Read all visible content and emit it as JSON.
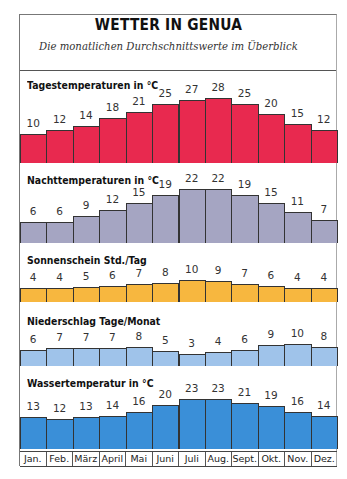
{
  "title": "WETTER IN GENUA",
  "subtitle": "Die monatlichen Durchschnittswerte im Überblick",
  "months": [
    "Jan.",
    "Feb.",
    "März",
    "April",
    "Mai",
    "Juni",
    "Juli",
    "Aug.",
    "Sept.",
    "Okt.",
    "Nov.",
    "Dez."
  ],
  "sections": [
    {
      "label": "Tagestemperaturen in °C",
      "color": "#e8294f",
      "values": [
        10,
        12,
        14,
        18,
        21,
        25,
        27,
        28,
        25,
        20,
        15,
        12
      ]
    },
    {
      "label": "Nachttemperaturen in °C",
      "color": "#a5a5c2",
      "values": [
        6,
        6,
        9,
        12,
        15,
        19,
        22,
        22,
        19,
        15,
        11,
        7
      ]
    },
    {
      "label": "Sonnenschein Std./Tag",
      "color": "#f7b73f",
      "values": [
        4,
        4,
        5,
        6,
        7,
        8,
        10,
        9,
        7,
        6,
        4,
        4
      ]
    },
    {
      "label": "Niederschlag Tage/Monat",
      "color": "#9fc3ea",
      "values": [
        6,
        7,
        7,
        7,
        8,
        5,
        3,
        4,
        6,
        9,
        10,
        8
      ]
    },
    {
      "label": "Wassertemperatur in °C",
      "color": "#3a8fd8",
      "values": [
        13,
        12,
        13,
        14,
        16,
        20,
        23,
        23,
        21,
        19,
        16,
        14
      ]
    }
  ],
  "chart_data": [
    {
      "type": "bar",
      "title": "Tagestemperaturen in °C",
      "categories": [
        "Jan.",
        "Feb.",
        "März",
        "April",
        "Mai",
        "Juni",
        "Juli",
        "Aug.",
        "Sept.",
        "Okt.",
        "Nov.",
        "Dez."
      ],
      "values": [
        10,
        12,
        14,
        18,
        21,
        25,
        27,
        28,
        25,
        20,
        15,
        12
      ],
      "color": "#e8294f"
    },
    {
      "type": "bar",
      "title": "Nachttemperaturen in °C",
      "categories": [
        "Jan.",
        "Feb.",
        "März",
        "April",
        "Mai",
        "Juni",
        "Juli",
        "Aug.",
        "Sept.",
        "Okt.",
        "Nov.",
        "Dez."
      ],
      "values": [
        6,
        6,
        9,
        12,
        15,
        19,
        22,
        22,
        19,
        15,
        11,
        7
      ],
      "color": "#a5a5c2"
    },
    {
      "type": "bar",
      "title": "Sonnenschein Std./Tag",
      "categories": [
        "Jan.",
        "Feb.",
        "März",
        "April",
        "Mai",
        "Juni",
        "Juli",
        "Aug.",
        "Sept.",
        "Okt.",
        "Nov.",
        "Dez."
      ],
      "values": [
        4,
        4,
        5,
        6,
        7,
        8,
        10,
        9,
        7,
        6,
        4,
        4
      ],
      "color": "#f7b73f"
    },
    {
      "type": "bar",
      "title": "Niederschlag Tage/Monat",
      "categories": [
        "Jan.",
        "Feb.",
        "März",
        "April",
        "Mai",
        "Juni",
        "Juli",
        "Aug.",
        "Sept.",
        "Okt.",
        "Nov.",
        "Dez."
      ],
      "values": [
        6,
        7,
        7,
        7,
        8,
        5,
        3,
        4,
        6,
        9,
        10,
        8
      ],
      "color": "#9fc3ea"
    },
    {
      "type": "bar",
      "title": "Wassertemperatur in °C",
      "categories": [
        "Jan.",
        "Feb.",
        "März",
        "April",
        "Mai",
        "Juni",
        "Juli",
        "Aug.",
        "Sept.",
        "Okt.",
        "Nov.",
        "Dez."
      ],
      "values": [
        13,
        12,
        13,
        14,
        16,
        20,
        23,
        23,
        21,
        19,
        16,
        14
      ],
      "color": "#3a8fd8"
    }
  ]
}
